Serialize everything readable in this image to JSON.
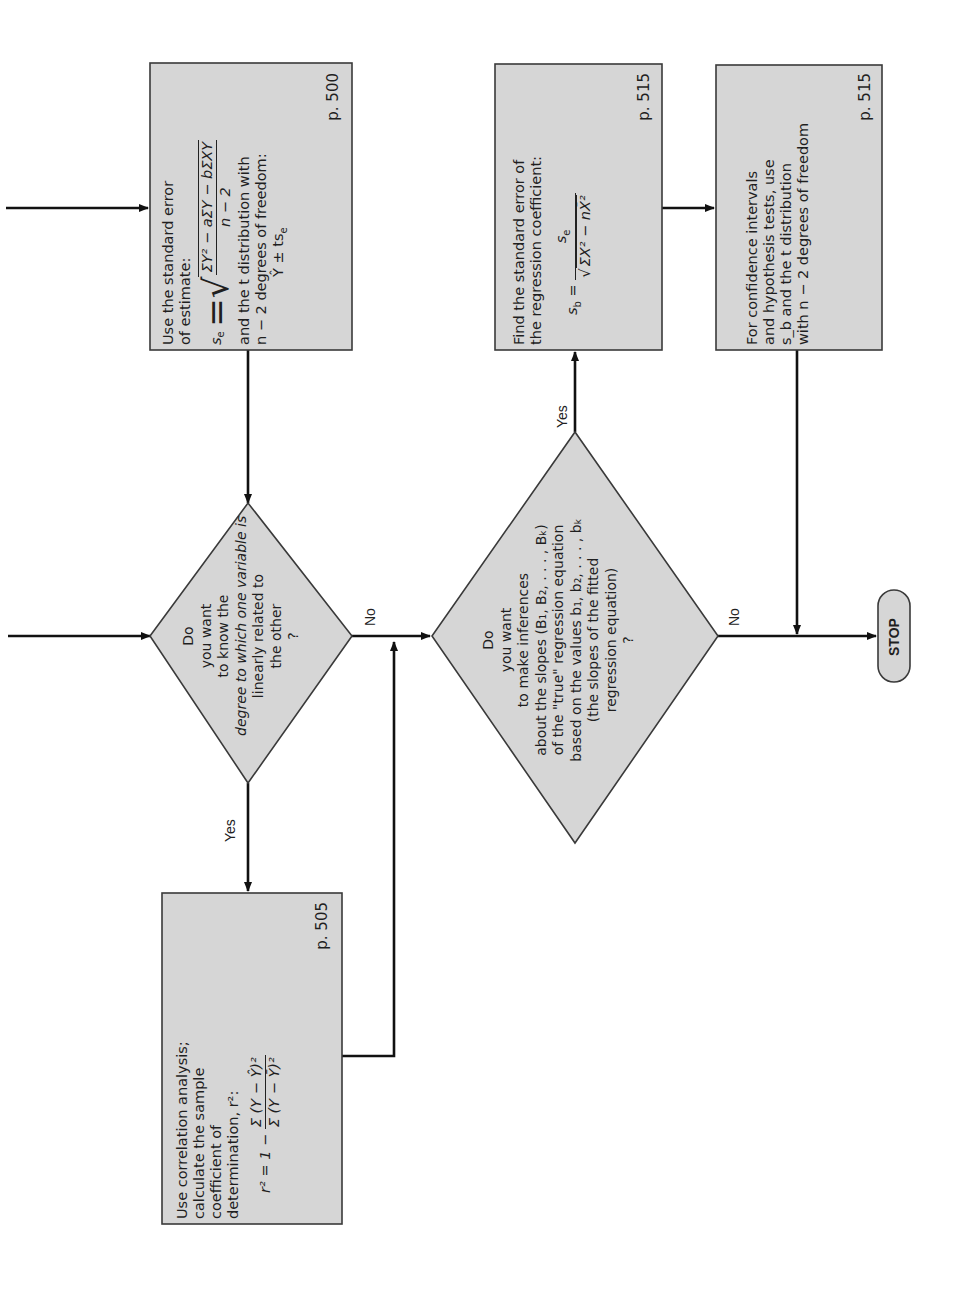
{
  "orientation": "rotated-90-ccw",
  "colors": {
    "shape_fill": "#d6d6d6",
    "shape_stroke": "#3a3a3a",
    "line": "#111111",
    "background": "#ffffff"
  },
  "nodes": {
    "std_error_estimate": {
      "line1": "Use the standard error",
      "line2": "of estimate:",
      "formula_lhs": "s",
      "formula_lhs_sub": "e",
      "formula_num": "ΣY² − aΣY − bΣXY",
      "formula_den": "n − 2",
      "line3": "and the t distribution with",
      "line4": "n − 2 degrees of freedom:",
      "line5": "Ŷ ± ts",
      "line5_sub": "e",
      "page_ref": "p. 500"
    },
    "decision_correlation": {
      "line1": "Do",
      "line2": "you want",
      "line3": "to know the",
      "line4": "degree to which one variable is",
      "line5": "linearly related to",
      "line6": "the other",
      "line7": "?"
    },
    "correlation_analysis": {
      "line1": "Use correlation analysis;",
      "line2": "calculate the sample",
      "line3": "coefficient of",
      "line4": "determination, r²:",
      "formula_lhs": "r² = 1 −",
      "formula_num": "Σ (Y − Ŷ)²",
      "formula_den": "Σ (Y − Ȳ)²",
      "page_ref": "p. 505"
    },
    "decision_slopes": {
      "line1": "Do",
      "line2": "you want",
      "line3": "to make inferences",
      "line4": "about the slopes (B₁, B₂, . . . , Bₖ)",
      "line5": "of the \"true\" regression equation",
      "line6": "based on the values b₁, b₂, . . . , bₖ",
      "line7": "(the slopes of the fitted",
      "line8": "regression equation)",
      "line9": "?"
    },
    "std_error_coefficient": {
      "line1": "Find the standard error of",
      "line2": "the regression coefficient:",
      "formula_lhs": "s",
      "formula_lhs_sub": "b",
      "formula_num": "s",
      "formula_num_sub": "e",
      "formula_den": "ΣX² − nX̄²",
      "page_ref": "p. 515"
    },
    "confidence_intervals": {
      "line1": "For confidence intervals",
      "line2": "and hypothesis tests, use",
      "line3": "s_b and the t distribution",
      "line4": "with n − 2 degrees of freedom",
      "page_ref": "p. 515"
    },
    "stop": {
      "label": "STOP"
    }
  },
  "edge_labels": {
    "d1_yes": "Yes",
    "d1_no": "No",
    "d2_yes": "Yes",
    "d2_no": "No"
  }
}
